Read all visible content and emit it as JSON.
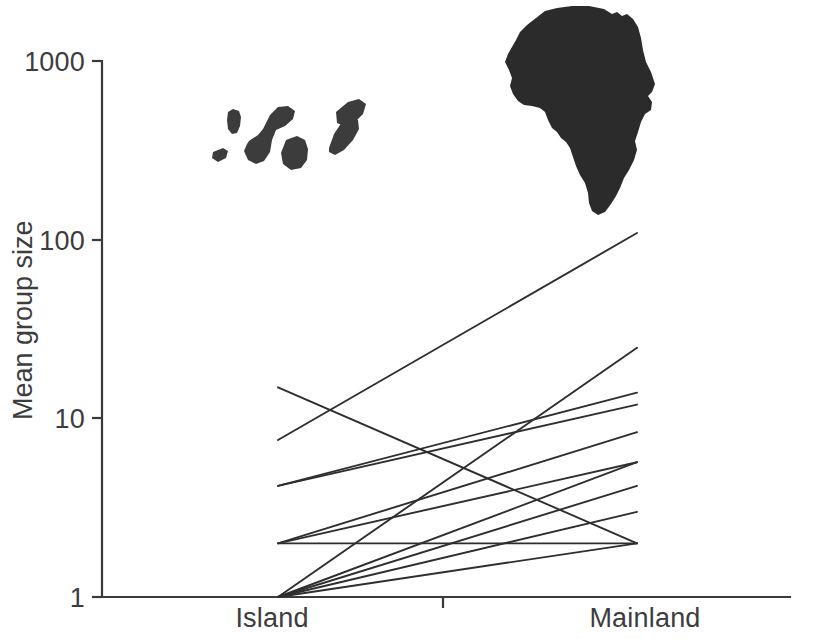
{
  "chart_data": {
    "type": "line",
    "title": "",
    "subtitle": "",
    "xlabel": "",
    "ylabel": "Mean group size",
    "x_categories": [
      "Island",
      "Mainland"
    ],
    "y_scale": "log10",
    "ylim": [
      1,
      1000
    ],
    "y_ticks": [
      1,
      10,
      100,
      1000
    ],
    "y_tick_labels": [
      "1",
      "10",
      "100",
      "1000"
    ],
    "x_tick_labels": [
      "Island",
      "Mainland"
    ],
    "grid": false,
    "legend": "none",
    "annotations": [
      {
        "name": "island-silhouette",
        "label": "Canary Islands archipelago silhouette",
        "side": "Island"
      },
      {
        "name": "africa-silhouette",
        "label": "Africa continent silhouette",
        "side": "Mainland"
      }
    ],
    "series": [
      {
        "name": "pair-1",
        "island": 15.0,
        "mainland": 2.0
      },
      {
        "name": "pair-2",
        "island": 7.6,
        "mainland": 110.0
      },
      {
        "name": "pair-3",
        "island": 4.2,
        "mainland": 14.0
      },
      {
        "name": "pair-4",
        "island": 4.2,
        "mainland": 12.0
      },
      {
        "name": "pair-5",
        "island": 2.0,
        "mainland": 8.4
      },
      {
        "name": "pair-6",
        "island": 2.0,
        "mainland": 5.7
      },
      {
        "name": "pair-7",
        "island": 2.0,
        "mainland": 2.0
      },
      {
        "name": "pair-8",
        "island": 1.0,
        "mainland": 25.0
      },
      {
        "name": "pair-9",
        "island": 1.0,
        "mainland": 5.7
      },
      {
        "name": "pair-10",
        "island": 1.0,
        "mainland": 4.2
      },
      {
        "name": "pair-11",
        "island": 1.0,
        "mainland": 3.0
      },
      {
        "name": "pair-12",
        "island": 1.0,
        "mainland": 2.0
      }
    ]
  },
  "axis": {
    "y_label": "Mean group size",
    "y_ticks": [
      "1000",
      "100",
      "10",
      "1"
    ],
    "x_ticks": [
      "Island",
      "Mainland"
    ]
  }
}
